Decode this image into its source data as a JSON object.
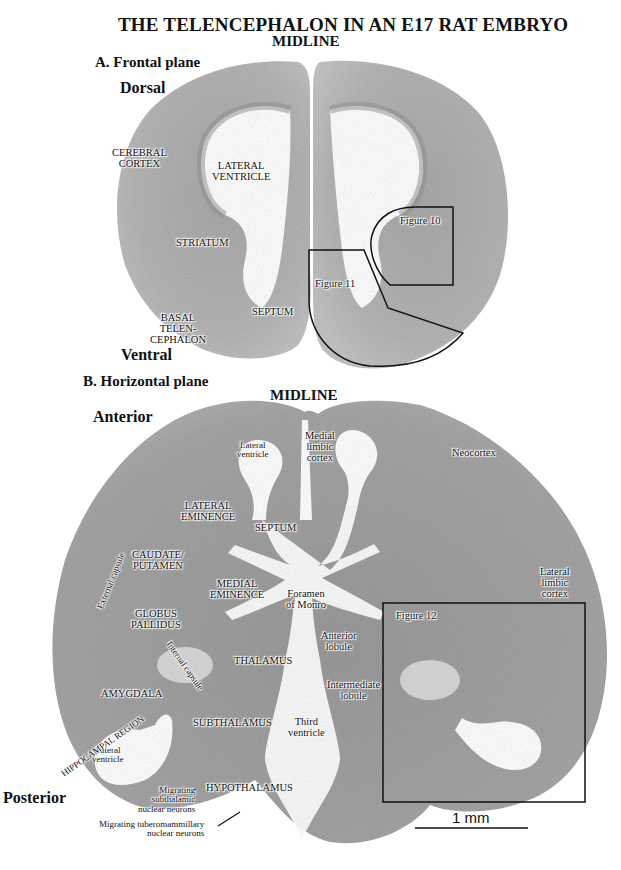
{
  "title": "THE TELENCEPHALON IN AN E17 RAT EMBRYO",
  "panel_a": {
    "heading": "A. Frontal plane",
    "midline": "MIDLINE",
    "orient_top": "Dorsal",
    "orient_bottom": "Ventral",
    "labels": {
      "cerebral_cortex": [
        "CEREBRAL",
        "CORTEX"
      ],
      "lateral_ventricle": [
        "LATERAL",
        "VENTRICLE"
      ],
      "striatum": "STRIATUM",
      "basal_telencephalon": [
        "BASAL",
        "TELEN-",
        "CEPHALON"
      ],
      "septum": "SEPTUM"
    },
    "figure_boxes": [
      "Figure 10",
      "Figure 11"
    ]
  },
  "panel_b": {
    "heading": "B. Horizontal plane",
    "midline": "MIDLINE",
    "orient_top": "Anterior",
    "orient_bottom": "Posterior",
    "labels": {
      "lateral_ventricle_ant": [
        "Lateral",
        "ventricle"
      ],
      "medial_limbic_cortex": [
        "Medial",
        "limbic",
        "cortex"
      ],
      "neocortex": "Neocortex",
      "lateral_eminence": [
        "LATERAL",
        "EMINENCE"
      ],
      "septum": "SEPTUM",
      "caudate_putamen": [
        "CAUDATE/",
        "PUTAMEN"
      ],
      "external_capsule": "External capsule",
      "medial_eminence": [
        "MEDIAL",
        "EMINENCE"
      ],
      "foramen_of_monro": [
        "Foramen",
        "of Monro"
      ],
      "lateral_limbic_cortex": [
        "Lateral",
        "limbic",
        "cortex"
      ],
      "globus_pallidus": [
        "GLOBUS",
        "PALLIDUS"
      ],
      "internal_capsule": "Internal capsule",
      "anterior_lobule": [
        "Anterior",
        "lobule"
      ],
      "thalamus": "THALAMUS",
      "amygdala": "AMYGDALA",
      "intermediate_lobule": [
        "Intermediate",
        "lobule"
      ],
      "subthalamus": "SUBTHALAMUS",
      "third_ventricle": [
        "Third",
        "ventricle"
      ],
      "lateral_ventricle_post": [
        "Lateral",
        "ventricle"
      ],
      "hippocampal_region": "HIPPOCAMPAL REGION",
      "migrating_subthalamic": [
        "Migrating",
        "subthalamic",
        "nuclear neurons"
      ],
      "hypothalamus": "HYPOTHALAMUS",
      "migrating_tuberomammillary": [
        "Migrating tuberomammillary",
        "nuclear neurons"
      ]
    },
    "figure_boxes": [
      "Figure 12"
    ]
  },
  "scale_bar": {
    "label": "1 mm"
  },
  "colors": {
    "tissue_light": "#b9b9b9",
    "tissue_mid": "#9e9e9e",
    "tissue_dark": "#8a8a8a",
    "ventricle": "#ffffff",
    "outline": "#111111"
  }
}
